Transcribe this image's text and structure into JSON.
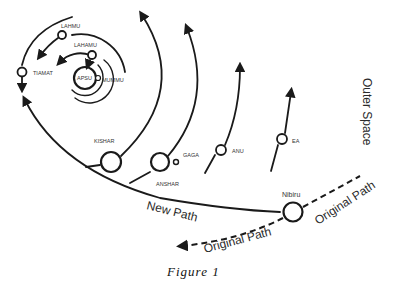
{
  "figure": {
    "caption": "Figure 1",
    "region_label": "Outer Space",
    "paths": {
      "new_path": "New Path",
      "original_path_incoming": "Original Path",
      "original_path_outgoing": "Original Path"
    },
    "bodies": [
      {
        "name": "APSU"
      },
      {
        "name": "MUMMU"
      },
      {
        "name": "LAHAMU"
      },
      {
        "name": "LAHMU"
      },
      {
        "name": "TIAMAT"
      },
      {
        "name": "KISHAR"
      },
      {
        "name": "ANSHAR"
      },
      {
        "name": "GAGA"
      },
      {
        "name": "ANU"
      },
      {
        "name": "EA"
      },
      {
        "name": "Nibiru"
      }
    ],
    "colors": {
      "ink": "#1a1a1a",
      "background": "#ffffff"
    }
  }
}
